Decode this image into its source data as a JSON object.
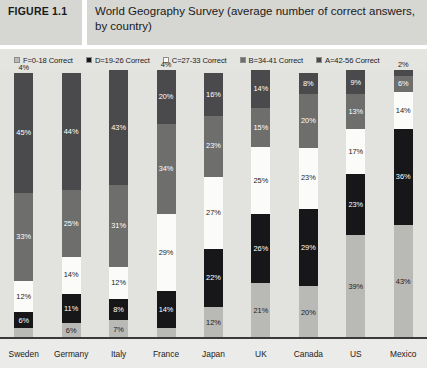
{
  "figure": {
    "number_label": "FIGURE 1.1",
    "title": "World Geography Survey (average number of correct answers, by country)"
  },
  "legend": {
    "position": "top",
    "items": [
      {
        "label": "F=0-18 Correct",
        "color": "#b9b9b6",
        "key": "F"
      },
      {
        "label": "D=19-26 Correct",
        "color": "#17171a",
        "key": "D"
      },
      {
        "label": "C=27-33 Correct",
        "color": "#fbfbfa",
        "key": "C"
      },
      {
        "label": "B=34-41 Correct",
        "color": "#6e6e6d",
        "key": "B"
      },
      {
        "label": "A=42-56 Correct",
        "color": "#4a4a4c",
        "key": "A"
      }
    ]
  },
  "chart_data": {
    "type": "bar",
    "subtype": "stacked-vertical-100",
    "title": "World Geography Survey (average number of correct answers, by country)",
    "xlabel": "",
    "ylabel": "",
    "ylim": [
      0,
      100
    ],
    "grid": false,
    "legend_position": "top",
    "stack_order_bottom_to_top": [
      "F",
      "D",
      "C",
      "B",
      "A"
    ],
    "categories": [
      "Sweden",
      "Germany",
      "Italy",
      "France",
      "Japan",
      "UK",
      "Canada",
      "US",
      "Mexico"
    ],
    "series": [
      {
        "name": "F=0-18 Correct",
        "color": "#b9b9b6",
        "values": [
          4,
          6,
          7,
          4,
          12,
          21,
          20,
          39,
          43
        ]
      },
      {
        "name": "D=19-26 Correct",
        "color": "#17171a",
        "values": [
          6,
          11,
          8,
          14,
          22,
          26,
          29,
          23,
          36
        ]
      },
      {
        "name": "C=27-33 Correct",
        "color": "#fbfbfa",
        "values": [
          12,
          14,
          12,
          29,
          27,
          25,
          23,
          17,
          14
        ]
      },
      {
        "name": "B=34-41 Correct",
        "color": "#6e6e6d",
        "values": [
          33,
          25,
          31,
          34,
          23,
          15,
          20,
          13,
          6
        ]
      },
      {
        "name": "A=42-56 Correct",
        "color": "#4a4a4c",
        "values": [
          45,
          44,
          43,
          20,
          16,
          14,
          8,
          9,
          2
        ]
      }
    ],
    "data_labels": {
      "Sweden": [
        "4%",
        "6%",
        "12%",
        "33%",
        "45%"
      ],
      "Germany": [
        "6%",
        "11%",
        "14%",
        "25%",
        "44%"
      ],
      "Italy": [
        "7%",
        "8%",
        "12%",
        "31%",
        "43%"
      ],
      "France": [
        "4%",
        "14%",
        "29%",
        "34%",
        "20%"
      ],
      "Japan": [
        "12%",
        "22%",
        "27%",
        "23%",
        "16%"
      ],
      "UK": [
        "21%",
        "26%",
        "25%",
        "15%",
        "14%"
      ],
      "Canada": [
        "20%",
        "29%",
        "23%",
        "20%",
        "8%"
      ],
      "US": [
        "39%",
        "23%",
        "17%",
        "13%",
        "9%"
      ],
      "Mexico": [
        "43%",
        "36%",
        "14%",
        "6%",
        "2%"
      ]
    }
  },
  "colors": {
    "background": "#ebebe9",
    "plot_background": "#e2e2df",
    "header_band": "#d6d6d3",
    "axis_line": "#3a3a38",
    "text": "#1b1b1b",
    "label_on_dark": "#ffffff",
    "label_on_light": "#1b1b1b"
  }
}
